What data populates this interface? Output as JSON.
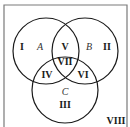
{
  "diagram": {
    "type": "venn",
    "colors": {
      "stroke": "#1a1a1a",
      "border": "#7a7a7a",
      "background": "#ffffff"
    },
    "sets": [
      {
        "name": "A",
        "cx": 46,
        "cy": 51,
        "r": 33
      },
      {
        "name": "B",
        "cx": 85,
        "cy": 51,
        "r": 33
      },
      {
        "name": "C",
        "cx": 65,
        "cy": 90,
        "r": 33
      }
    ],
    "regions": [
      {
        "label": "I",
        "x": 22,
        "y": 50
      },
      {
        "label": "II",
        "x": 107,
        "y": 50
      },
      {
        "label": "III",
        "x": 65,
        "y": 108
      },
      {
        "label": "IV",
        "x": 47,
        "y": 78
      },
      {
        "label": "V",
        "x": 65,
        "y": 50
      },
      {
        "label": "VI",
        "x": 83,
        "y": 78
      },
      {
        "label": "VII",
        "x": 65,
        "y": 65
      },
      {
        "label": "VIII",
        "x": 116,
        "y": 124
      }
    ],
    "set_labels": [
      {
        "label": "A",
        "x": 40,
        "y": 50
      },
      {
        "label": "B",
        "x": 89,
        "y": 50
      },
      {
        "label": "C",
        "x": 65,
        "y": 95
      }
    ]
  }
}
